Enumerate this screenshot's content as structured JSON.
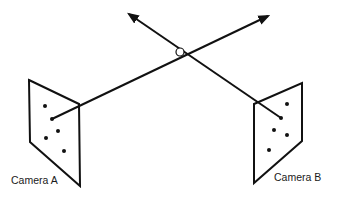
{
  "diagram": {
    "title": "",
    "cameras": [
      {
        "id": "A",
        "label": "Camera A",
        "image_points": 5
      },
      {
        "id": "B",
        "label": "Camera B",
        "image_points": 5
      }
    ],
    "rays": [
      {
        "from": "Camera A",
        "direction": "up-right",
        "arrowhead": true
      },
      {
        "from": "Camera B",
        "direction": "up-left",
        "arrowhead": true
      }
    ],
    "intersection": {
      "marker": "open-circle",
      "meaning": "triangulated 3D point"
    }
  },
  "colors": {
    "line": "#111111",
    "background": "#ffffff",
    "text": "#1a1a1a"
  }
}
